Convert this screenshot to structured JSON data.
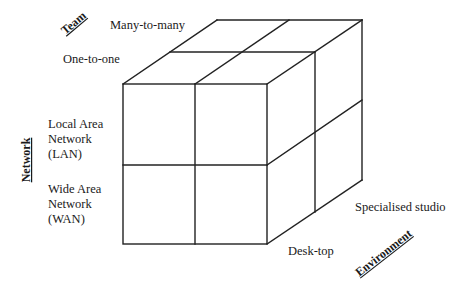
{
  "diagram": {
    "type": "3D cube classification",
    "axes": {
      "team": {
        "label": "Team",
        "values": [
          "Many-to-many",
          "One-to-one"
        ]
      },
      "network": {
        "label": "Network",
        "values": [
          {
            "lines": [
              "Local Area",
              "Network",
              "(LAN)"
            ]
          },
          {
            "lines": [
              "Wide Area",
              "Network",
              "(WAN)"
            ]
          }
        ]
      },
      "environment": {
        "label": "Environment",
        "values": [
          "Desk-top",
          "Specialised studio"
        ]
      }
    },
    "colors": {
      "line": "#222222",
      "text": "#1a1a1a",
      "background": "#ffffff"
    }
  }
}
